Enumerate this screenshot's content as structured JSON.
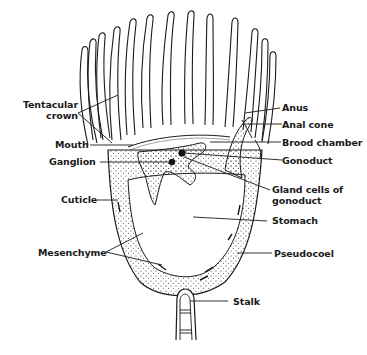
{
  "diagram": {
    "colors": {
      "line": "#1a1a1a",
      "background": "#ffffff",
      "stipple": "#333333"
    },
    "labels": {
      "tentacular_crown_1": "Tentacular",
      "tentacular_crown_2": "crown",
      "mouth": "Mouth",
      "ganglion": "Ganglion",
      "cuticle": "Cuticle",
      "mesenchyme": "Mesenchyme",
      "anus": "Anus",
      "anal_cone": "Anal cone",
      "brood_chamber": "Brood chamber",
      "gonoduct": "Gonoduct",
      "gland_cells_1": "Gland cells of",
      "gland_cells_2": "gonoduct",
      "stomach": "Stomach",
      "pseudocoel": "Pseudocoel",
      "stalk": "Stalk"
    }
  }
}
